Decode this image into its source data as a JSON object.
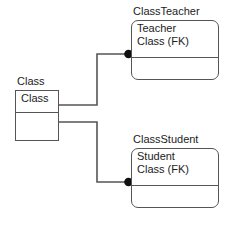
{
  "diagram": {
    "type": "entity-relationship",
    "background_color": "#ffffff",
    "line_color": "#555555",
    "text_color": "#1c1c1c",
    "endpoint_marker": "filled-circle",
    "entities": [
      {
        "id": "class",
        "caption": "Class",
        "shape": "rectangle",
        "attributes": [
          "Class"
        ],
        "lower_compartment": ""
      },
      {
        "id": "classteacher",
        "caption": "ClassTeacher",
        "shape": "rounded-rectangle",
        "attributes": [
          "Teacher",
          "Class (FK)"
        ],
        "lower_compartment": ""
      },
      {
        "id": "classstudent",
        "caption": "ClassStudent",
        "shape": "rounded-rectangle",
        "attributes": [
          "Student",
          "Class (FK)"
        ],
        "lower_compartment": ""
      }
    ],
    "relationships": [
      {
        "id": "class-to-classteacher",
        "from": "class",
        "to": "classteacher",
        "to_marker": "filled-circle"
      },
      {
        "id": "class-to-classstudent",
        "from": "class",
        "to": "classstudent",
        "to_marker": "filled-circle"
      }
    ]
  }
}
